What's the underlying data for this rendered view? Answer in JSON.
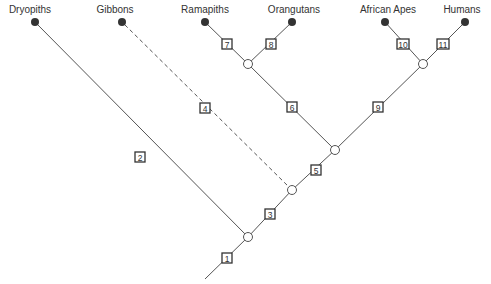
{
  "diagram": {
    "type": "phylogenetic-tree",
    "line_color": "#555555",
    "taxa": [
      {
        "id": "dryopiths",
        "label": "Dryopiths",
        "x": 35,
        "y": 22,
        "lx": 30
      },
      {
        "id": "gibbons",
        "label": "Gibbons",
        "x": 122,
        "y": 22,
        "lx": 115
      },
      {
        "id": "ramapiths",
        "label": "Ramapiths",
        "x": 205,
        "y": 22,
        "lx": 205
      },
      {
        "id": "orangutans",
        "label": "Orangutans",
        "x": 292,
        "y": 22,
        "lx": 294
      },
      {
        "id": "african-apes",
        "label": "African Apes",
        "x": 385,
        "y": 22,
        "lx": 388
      },
      {
        "id": "humans",
        "label": "Humans",
        "x": 465,
        "y": 22,
        "lx": 462
      }
    ],
    "nodes": [
      {
        "id": "n-ram-ora",
        "x": 248,
        "y": 64
      },
      {
        "id": "n-afr-hum",
        "x": 423,
        "y": 64
      },
      {
        "id": "n-great",
        "x": 335,
        "y": 150
      },
      {
        "id": "n-gibbon",
        "x": 292,
        "y": 190
      },
      {
        "id": "n-dryo",
        "x": 248,
        "y": 237
      }
    ],
    "edges": [
      {
        "from": [
          205,
          279
        ],
        "to": [
          248,
          237
        ],
        "dashed": false
      },
      {
        "from": [
          248,
          237
        ],
        "to": [
          35,
          22
        ],
        "dashed": false
      },
      {
        "from": [
          248,
          237
        ],
        "to": [
          292,
          190
        ],
        "dashed": false
      },
      {
        "from": [
          292,
          190
        ],
        "to": [
          122,
          22
        ],
        "dashed": true
      },
      {
        "from": [
          292,
          190
        ],
        "to": [
          335,
          150
        ],
        "dashed": false
      },
      {
        "from": [
          335,
          150
        ],
        "to": [
          248,
          64
        ],
        "dashed": false
      },
      {
        "from": [
          248,
          64
        ],
        "to": [
          205,
          22
        ],
        "dashed": false
      },
      {
        "from": [
          248,
          64
        ],
        "to": [
          292,
          22
        ],
        "dashed": false
      },
      {
        "from": [
          335,
          150
        ],
        "to": [
          423,
          64
        ],
        "dashed": false
      },
      {
        "from": [
          423,
          64
        ],
        "to": [
          385,
          22
        ],
        "dashed": false
      },
      {
        "from": [
          423,
          64
        ],
        "to": [
          465,
          22
        ],
        "dashed": false
      }
    ],
    "markers": [
      {
        "n": "1",
        "x": 227,
        "y": 258
      },
      {
        "n": "2",
        "x": 140,
        "y": 157
      },
      {
        "n": "3",
        "x": 270,
        "y": 214
      },
      {
        "n": "4",
        "x": 205,
        "y": 108
      },
      {
        "n": "5",
        "x": 316,
        "y": 170
      },
      {
        "n": "6",
        "x": 292,
        "y": 107
      },
      {
        "n": "7",
        "x": 227,
        "y": 44
      },
      {
        "n": "8",
        "x": 271,
        "y": 44
      },
      {
        "n": "9",
        "x": 378,
        "y": 107
      },
      {
        "n": "10",
        "x": 403,
        "y": 44
      },
      {
        "n": "11",
        "x": 443,
        "y": 44
      }
    ]
  }
}
